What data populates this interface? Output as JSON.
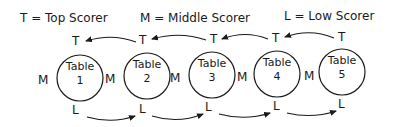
{
  "legend": [
    {
      "symbol": "T",
      "equals": "=",
      "meaning": "Top Scorer"
    },
    {
      "symbol": "M",
      "equals": "=",
      "meaning": "Middle Scorer"
    },
    {
      "symbol": "L",
      "equals": "=",
      "meaning": "Low Scorer"
    }
  ],
  "legend_text": {
    "top": "T = Top Scorer",
    "middle": "M = Middle Scorer",
    "low": "L = Low Scorer"
  },
  "tables": [
    {
      "label": "Table",
      "number": "1",
      "top": "T",
      "middle": "M",
      "low": "L"
    },
    {
      "label": "Table",
      "number": "2",
      "top": "T",
      "middle": "M",
      "low": "L"
    },
    {
      "label": "Table",
      "number": "3",
      "top": "T",
      "middle": "M",
      "low": "L"
    },
    {
      "label": "Table",
      "number": "4",
      "top": "T",
      "middle": "M",
      "low": "L"
    },
    {
      "label": "Table",
      "number": "5",
      "top": "T",
      "middle": "M",
      "low": "L"
    }
  ],
  "flows": {
    "top_scorers": "move one table left (toward Table 1)",
    "low_scorers": "move one table right (toward Table 5)",
    "middle_scorers": "stay at table"
  },
  "colors": {
    "ink": "#1a1a1a",
    "background": "#ffffff"
  }
}
